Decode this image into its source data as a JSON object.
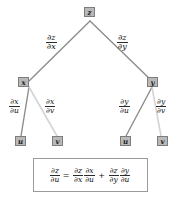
{
  "diagram": {
    "type": "tree-diagram",
    "colors": {
      "node_fill": "#b9b9b9",
      "node_border": "#7d7d7d",
      "edge_dark": "#8d8d8d",
      "edge_light": "#d4d4d4",
      "box_border": "#9a9a9a",
      "background": "#ffffff",
      "text": "#111111"
    },
    "nodes": {
      "root": {
        "label": "z"
      },
      "level1": [
        {
          "label": "x"
        },
        {
          "label": "y"
        }
      ],
      "level2": [
        {
          "label": "u"
        },
        {
          "label": "v"
        },
        {
          "label": "u"
        },
        {
          "label": "v"
        }
      ]
    },
    "edge_labels": {
      "z_to_x": {
        "num": "∂z",
        "den": "∂x"
      },
      "z_to_y": {
        "num": "∂z",
        "den": "∂y"
      },
      "x_to_u": {
        "num": "∂x",
        "den": "∂u"
      },
      "x_to_v": {
        "num": "∂x",
        "den": "∂v"
      },
      "y_to_u": {
        "num": "∂y",
        "den": "∂u"
      },
      "y_to_v": {
        "num": "∂y",
        "den": "∂v"
      }
    }
  },
  "formula": {
    "lhs": {
      "num": "∂z",
      "den": "∂u"
    },
    "equals": "=",
    "term1_a": {
      "num": "∂z",
      "den": "∂x"
    },
    "term1_b": {
      "num": "∂x",
      "den": "∂u"
    },
    "plus": "+",
    "term2_a": {
      "num": "∂z",
      "den": "∂y"
    },
    "term2_b": {
      "num": "∂y",
      "den": "∂u"
    }
  }
}
